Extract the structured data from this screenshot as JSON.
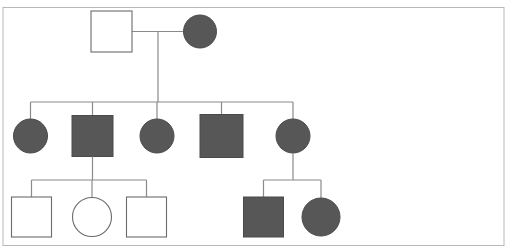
{
  "figure": {
    "type": "pedigree-chart",
    "title": "",
    "width": 516,
    "height": 246,
    "background_color": "#ffffff"
  },
  "style": {
    "affected_fill": "#575757",
    "unaffected_fill": "#ffffff",
    "symbol_stroke": "#4a4a4a",
    "line_stroke": "#8a8a8a",
    "frame_stroke": "#b8b8b8",
    "symbol_stroke_width": 1,
    "line_stroke_width": 1.2,
    "frame_stroke_width": 1
  },
  "frame": {
    "name": "page-border",
    "x": 3,
    "y": 7.5,
    "width": 501,
    "height": 238
  },
  "legend": {
    "square_meaning": "male",
    "circle_meaning": "female",
    "filled_meaning": "affected",
    "open_meaning": "unaffected"
  },
  "chart_data": {
    "type": "pedigree",
    "generations": [
      {
        "id": "I",
        "label": "I",
        "individuals": [
          {
            "id": "I-1",
            "sex": "male",
            "shape": "square",
            "affected": false,
            "cx": 111.5,
            "cy": 31.5,
            "size": 41
          },
          {
            "id": "I-2",
            "sex": "female",
            "shape": "circle",
            "affected": true,
            "cx": 200.0,
            "cy": 31.5,
            "r": 16.5
          }
        ]
      },
      {
        "id": "II",
        "label": "II",
        "individuals": [
          {
            "id": "II-1",
            "sex": "female",
            "shape": "circle",
            "affected": true,
            "cx": 30.5,
            "cy": 136.0,
            "r": 17.0
          },
          {
            "id": "II-2",
            "sex": "male",
            "shape": "square",
            "affected": true,
            "cx": 92.5,
            "cy": 136.0,
            "size": 41
          },
          {
            "id": "II-3",
            "sex": "female",
            "shape": "circle",
            "affected": true,
            "cx": 157.0,
            "cy": 136.0,
            "r": 17.0
          },
          {
            "id": "II-4",
            "sex": "male",
            "shape": "square",
            "affected": true,
            "cx": 221.5,
            "cy": 136.0,
            "size": 43
          },
          {
            "id": "II-5",
            "sex": "female",
            "shape": "circle",
            "affected": true,
            "cx": 293.0,
            "cy": 136.0,
            "r": 17.0
          }
        ]
      },
      {
        "id": "III",
        "label": "III",
        "individuals": [
          {
            "id": "III-1",
            "sex": "male",
            "shape": "square",
            "affected": false,
            "cx": 31.5,
            "cy": 217.0,
            "size": 40
          },
          {
            "id": "III-2",
            "sex": "female",
            "shape": "circle",
            "affected": false,
            "cx": 92.0,
            "cy": 217.0,
            "r": 19.5
          },
          {
            "id": "III-3",
            "sex": "male",
            "shape": "square",
            "affected": false,
            "cx": 146.5,
            "cy": 217.0,
            "size": 40
          },
          {
            "id": "III-4",
            "sex": "male",
            "shape": "square",
            "affected": true,
            "cx": 263.5,
            "cy": 217.0,
            "size": 40
          },
          {
            "id": "III-5",
            "sex": "female",
            "shape": "circle",
            "affected": true,
            "cx": 321.0,
            "cy": 217.0,
            "r": 19.0
          }
        ]
      }
    ],
    "matings": [
      {
        "id": "mating-I",
        "partners": [
          "I-1",
          "I-2"
        ],
        "mating_line_y": 31.5,
        "mating_line_x1": 132.0,
        "mating_line_x2": 184.0,
        "descent_x": 158.0,
        "sibship_line_y": 102.0,
        "sibship_x1": 30.5,
        "sibship_x2": 293.0,
        "children": [
          "II-1",
          "II-2",
          "II-3",
          "II-4",
          "II-5"
        ]
      },
      {
        "id": "mating-II-2",
        "partners": [
          "II-2"
        ],
        "descent_x": 92.5,
        "descent_y1": 156.5,
        "sibship_line_y": 180.0,
        "sibship_x1": 31.5,
        "sibship_x2": 146.5,
        "children": [
          "III-1",
          "III-2",
          "III-3"
        ]
      },
      {
        "id": "mating-II-5",
        "partners": [
          "II-5"
        ],
        "descent_x": 293.0,
        "descent_y1": 153.0,
        "sibship_line_y": 180.0,
        "sibship_x1": 263.5,
        "sibship_x2": 321.0,
        "children": [
          "III-4",
          "III-5"
        ]
      }
    ],
    "counts": {
      "total_individuals": 12,
      "affected": 7,
      "unaffected": 5,
      "males": 6,
      "females": 6,
      "generations": 3
    }
  }
}
